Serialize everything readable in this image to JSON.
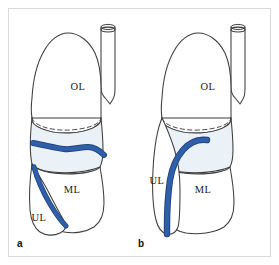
{
  "figure": {
    "caption_panels": [
      "a",
      "b"
    ],
    "background_color": "#ffffff",
    "frame_color": "#d9d9d9",
    "outline_color": "#3d3d3d",
    "vessel_color": "#2f5fa8",
    "vessel_shadow_color": "#1f3f75",
    "band_fill_color": "#eaf1f7",
    "lung_fill_color": "#ffffff"
  },
  "panel_a": {
    "id": "a",
    "labels": {
      "upper_lobe": "OL",
      "middle_lobe": "ML",
      "lower_lobe": "UL"
    },
    "label_positions": {
      "upper_lobe": {
        "x": 78,
        "y": 90
      },
      "middle_lobe": {
        "x": 72,
        "y": 193
      },
      "lower_lobe": {
        "x": 39,
        "y": 221
      }
    },
    "panel_letter_position": {
      "x": 17,
      "y": 247
    },
    "vessel_description": "horizontal branch crossing the band, second branch descending to lower lobe"
  },
  "panel_b": {
    "id": "b",
    "labels": {
      "upper_lobe": "OL",
      "middle_lobe": "ML",
      "lower_lobe": "UL"
    },
    "label_positions": {
      "upper_lobe": {
        "x": 208,
        "y": 90
      },
      "middle_lobe": {
        "x": 203,
        "y": 193
      },
      "lower_lobe": {
        "x": 157,
        "y": 184
      }
    },
    "panel_letter_position": {
      "x": 138,
      "y": 247
    },
    "vessel_description": "single continuous vessel descending from band through lower lobe"
  }
}
